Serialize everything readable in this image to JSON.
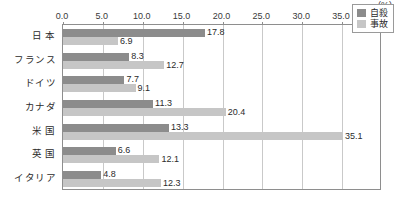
{
  "chart_data": {
    "type": "bar",
    "orientation": "horizontal",
    "title": "",
    "xlabel": "",
    "ylabel": "",
    "unit": "(%)",
    "xlim": [
      0.0,
      40.0
    ],
    "xticks": [
      "0.0",
      "5.0",
      "10.0",
      "15.0",
      "20.0",
      "25.0",
      "30.0",
      "35.0",
      "40.0"
    ],
    "xtick_values": [
      0.0,
      5.0,
      10.0,
      15.0,
      20.0,
      25.0,
      30.0,
      35.0,
      40.0
    ],
    "grid": true,
    "legend_position": "top-right",
    "categories": [
      "日 本",
      "フランス",
      "ドイツ",
      "カナダ",
      "米 国",
      "英 国",
      "イタリア"
    ],
    "series": [
      {
        "name": "自殺",
        "color": "#8c8c8c",
        "values": [
          17.8,
          8.3,
          7.7,
          11.3,
          13.3,
          6.6,
          4.8
        ],
        "labels": [
          "17.8",
          "8.3",
          "7.7",
          "11.3",
          "13.3",
          "6.6",
          "4.8"
        ]
      },
      {
        "name": "事故",
        "color": "#c6c6c6",
        "values": [
          6.9,
          12.7,
          9.1,
          20.4,
          35.1,
          12.1,
          12.3
        ],
        "labels": [
          "6.9",
          "12.7",
          "9.1",
          "20.4",
          "35.1",
          "12.1",
          "12.3"
        ]
      }
    ]
  },
  "legend": {
    "items": [
      {
        "label": "自殺",
        "swatch": "suicide"
      },
      {
        "label": "事故",
        "swatch": "accident"
      }
    ]
  }
}
